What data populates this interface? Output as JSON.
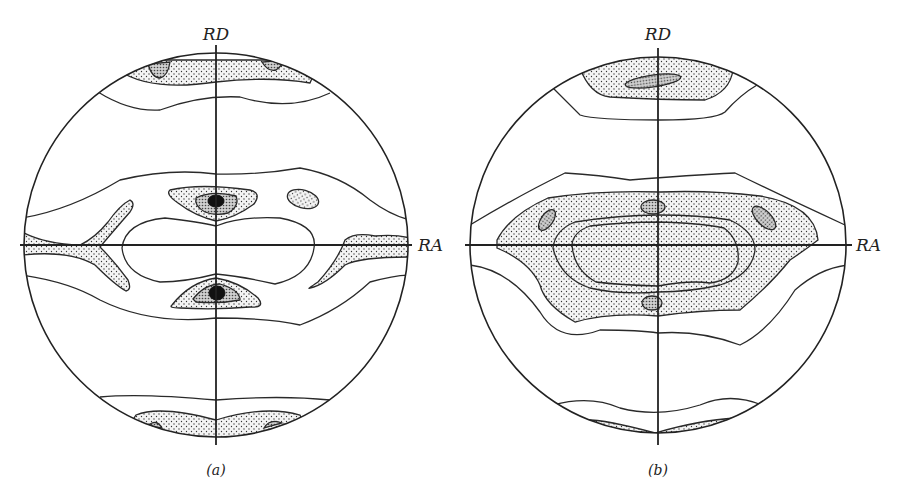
{
  "figure": {
    "panels": [
      {
        "id": "a",
        "caption": "(a)",
        "axis_top_label": "RD",
        "axis_right_label": "RA",
        "contour_levels": [
          "line",
          "light-stipple",
          "dense-stipple",
          "solid-max"
        ]
      },
      {
        "id": "b",
        "caption": "(b)",
        "axis_top_label": "RD",
        "axis_right_label": "RA",
        "contour_levels": [
          "line",
          "light-stipple",
          "dense-stipple"
        ]
      }
    ]
  }
}
